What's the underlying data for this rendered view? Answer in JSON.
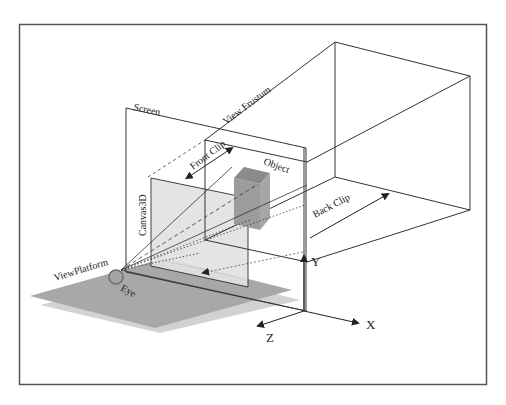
{
  "diagram": {
    "labels": {
      "screen": "Screen",
      "view_frustum": "View Frustum",
      "front_clip": "Front Clip",
      "back_clip": "Back Clip",
      "object": "Object",
      "canvas3d": "Canvas3D",
      "view_platform": "ViewPlatform",
      "eye": "Eye",
      "axis_x": "X",
      "axis_y": "Y",
      "axis_z": "Z"
    },
    "colors": {
      "background": "#ffffff",
      "frame": "#444444",
      "line": "#333333",
      "floor": "#a9a9a9",
      "floor_shadow": "#cfcfcf",
      "canvas_fill": "#e6e6e6",
      "object_front": "#9a9a9a",
      "object_top": "#8a8a8a",
      "eye_fill": "#a0a0a0",
      "eye_stroke": "#707070"
    }
  }
}
